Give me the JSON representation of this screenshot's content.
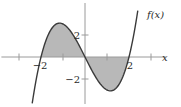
{
  "chart_data": {
    "type": "line",
    "title": "",
    "function_label": "f(x)",
    "xlabel": "x",
    "ylabel": "",
    "formula": "f(x) = x^3 - 4x",
    "xlim": [
      -3.8,
      4.2
    ],
    "ylim": [
      -4.5,
      5.2
    ],
    "x_ticks": [
      -3,
      -1,
      1,
      3
    ],
    "x_tick_labels": [
      {
        "value": -2,
        "label": "−2"
      },
      {
        "value": 2,
        "label": "2"
      }
    ],
    "y_ticks": [
      2,
      -2
    ],
    "y_tick_labels": [
      {
        "value": 2,
        "label": "2"
      },
      {
        "value": -2,
        "label": "−2"
      }
    ],
    "curve_domain": [
      -2.4,
      2.4
    ],
    "shaded_region": {
      "from": -2,
      "to": 2,
      "between": "curve and x-axis",
      "color": "#b8b8b8"
    },
    "series": [
      {
        "name": "f(x)",
        "x": [
          -2.4,
          -2.0,
          -1.5,
          -1.1547,
          -1.0,
          -0.5,
          0.0,
          0.5,
          1.0,
          1.1547,
          1.5,
          2.0,
          2.4
        ],
        "values": [
          -4.22,
          0.0,
          2.63,
          3.08,
          3.0,
          1.88,
          0.0,
          -1.88,
          -3.0,
          -3.08,
          -2.63,
          0.0,
          4.22
        ]
      }
    ],
    "roots": [
      -2,
      0,
      2
    ],
    "local_max": {
      "x": -1.1547,
      "y": 3.08
    },
    "local_min": {
      "x": 1.1547,
      "y": -3.08
    },
    "grid": false,
    "legend": "none",
    "colors": {
      "curve": "#3a3a3a",
      "axis": "#9a9a9a",
      "fill": "#b8b8b8"
    }
  },
  "layout": {
    "origin_px": [
      85,
      57
    ],
    "unit_x_px": 22,
    "unit_y_px": 11
  }
}
